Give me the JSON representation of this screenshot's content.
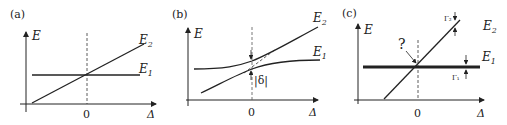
{
  "panels": [
    {
      "label": "(a)",
      "y_axis": "E",
      "x_axis": "Δ",
      "zero": "0",
      "curve_upper": "E",
      "curve_upper_sub": "2",
      "curve_lower": "E",
      "curve_lower_sub": "1"
    },
    {
      "label": "(b)",
      "y_axis": "E",
      "x_axis": "Δ",
      "zero": "0",
      "curve_upper": "E",
      "curve_upper_sub": "2",
      "curve_lower": "E",
      "curve_lower_sub": "1",
      "gap_label": "|δ|"
    },
    {
      "label": "(c)",
      "y_axis": "E",
      "x_axis": "Δ",
      "zero": "0",
      "curve_upper": "E",
      "curve_upper_sub": "2",
      "curve_lower": "E",
      "curve_lower_sub": "1",
      "question": "?",
      "width_upper": "Γ₂",
      "width_lower": "Γ₁"
    }
  ]
}
